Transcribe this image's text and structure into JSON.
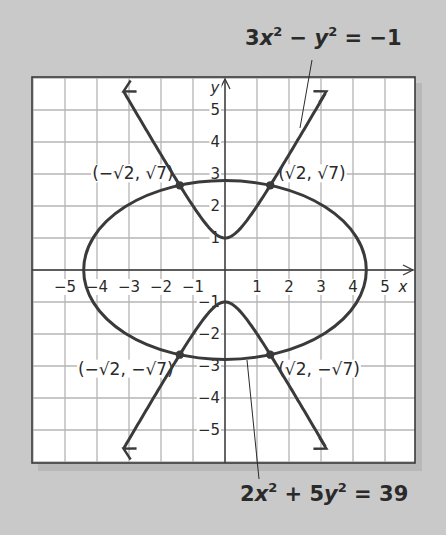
{
  "chart_data": {
    "type": "line",
    "title": "",
    "xlabel": "x",
    "ylabel": "y",
    "xlim": [
      -6,
      6
    ],
    "ylim": [
      -6,
      6
    ],
    "grid": true,
    "x_ticks": [
      -5,
      -4,
      -3,
      -2,
      -1,
      1,
      2,
      3,
      4,
      5
    ],
    "y_ticks": [
      -5,
      -4,
      -3,
      -2,
      -1,
      1,
      2,
      3,
      4,
      5
    ],
    "x_tick_labels": [
      "−5",
      "−4",
      "−3",
      "−2",
      "−1",
      "1",
      "2",
      "3",
      "4",
      "5"
    ],
    "y_tick_labels": [
      "−5",
      "−4",
      "−3",
      "−2",
      "−1",
      "1",
      "2",
      "3",
      "4",
      "5"
    ],
    "series": [
      {
        "name": "3x² − y² = −1",
        "kind": "hyperbola",
        "equation": {
          "a_x2": 3,
          "b_y2": -1,
          "rhs": -1
        },
        "vertices": [
          [
            0,
            1
          ],
          [
            0,
            -1
          ]
        ],
        "asymptotes": "y = ±√3 x",
        "arrows": true
      },
      {
        "name": "2x² + 5y² = 39",
        "kind": "ellipse",
        "equation": {
          "a_x2": 2,
          "b_y2": 5,
          "rhs": 39
        },
        "semi_axis_x": 4.416,
        "semi_axis_y": 2.793
      }
    ],
    "points": [
      {
        "label": "(−√2, √7)",
        "x": -1.414,
        "y": 2.646
      },
      {
        "label": "(√2, √7)",
        "x": 1.414,
        "y": 2.646
      },
      {
        "label": "(−√2, −√7)",
        "x": -1.414,
        "y": -2.646
      },
      {
        "label": "(√2, −√7)",
        "x": 1.414,
        "y": -2.646
      }
    ],
    "annotations": [
      {
        "text": "3x² − y² = −1",
        "target": "hyperbola",
        "position": "top-right"
      },
      {
        "text": "2x² + 5y² = 39",
        "target": "ellipse",
        "position": "bottom-right"
      }
    ]
  },
  "labels": {
    "hyperbola_eq": {
      "c1": "3",
      "v1": "x",
      "e1": "2",
      "op": " − ",
      "v2": "y",
      "e2": "2",
      "rhs": " = −1"
    },
    "ellipse_eq": {
      "c1": "2",
      "v1": "x",
      "e1": "2",
      "op": " + 5",
      "v2": "y",
      "e2": "2",
      "rhs": " = 39"
    },
    "x_axis": "x",
    "y_axis": "y"
  },
  "colors": {
    "background": "#c9c9c9",
    "plot_bg": "#ffffff",
    "grid": "#b4b4b4",
    "curve": "#3a3a3a",
    "axis": "#3a3a3a",
    "text": "#2a2a2a"
  }
}
